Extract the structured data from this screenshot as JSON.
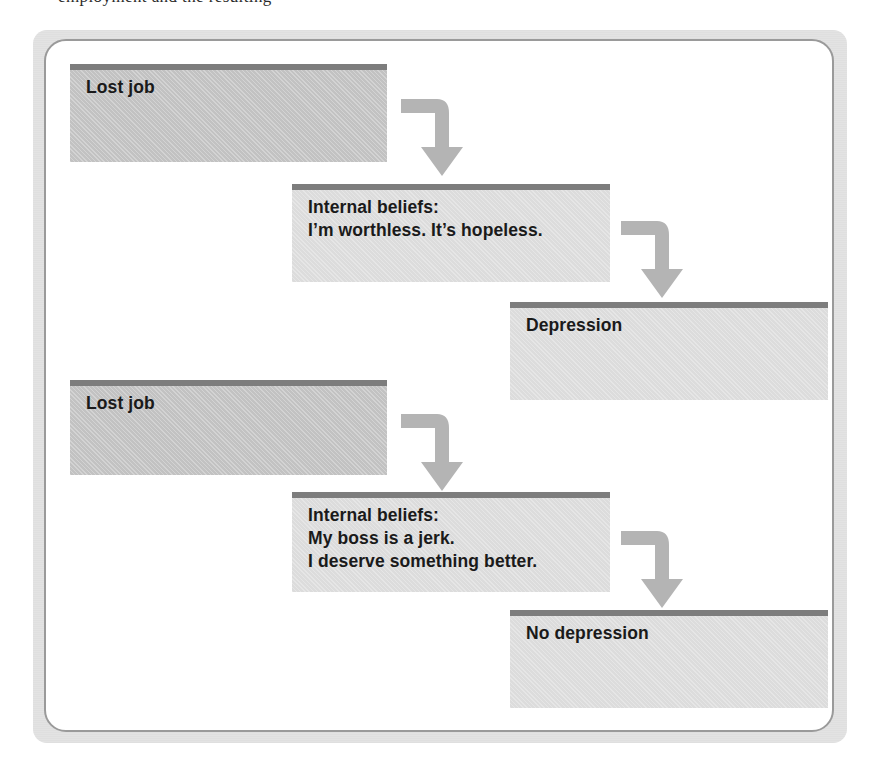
{
  "figure": {
    "type": "flowchart",
    "top_clipped_text": "employment and the resulting",
    "colors": {
      "box_top_bar": "#7d7d7d",
      "box_fill_dark": "#c2c2c2",
      "box_fill_light": "#dcdcdc",
      "arrow": "#b4b4b4",
      "panel_background": "#ffffff",
      "panel_border": "#9a9a9a",
      "scan_band": "#e3e3e3",
      "text": "#1a1a1a"
    },
    "chains": [
      {
        "name": "depression-chain",
        "nodes": [
          {
            "id": "lost-job-1",
            "label": "Lost job",
            "tone": "dark"
          },
          {
            "id": "internal-beliefs-1",
            "label": "Internal beliefs:\nI’m worthless. It’s hopeless.",
            "tone": "light"
          },
          {
            "id": "depression",
            "label": "Depression",
            "tone": "light"
          }
        ]
      },
      {
        "name": "no-depression-chain",
        "nodes": [
          {
            "id": "lost-job-2",
            "label": "Lost job",
            "tone": "dark"
          },
          {
            "id": "internal-beliefs-2",
            "label": "Internal beliefs:\nMy boss is a jerk.\nI deserve something better.",
            "tone": "light"
          },
          {
            "id": "no-depression",
            "label": "No depression",
            "tone": "light"
          }
        ]
      }
    ],
    "connectors": [
      {
        "id": "arrow-1",
        "from": "lost-job-1",
        "to": "internal-beliefs-1",
        "shape": "elbow-right-down"
      },
      {
        "id": "arrow-2",
        "from": "internal-beliefs-1",
        "to": "depression",
        "shape": "elbow-right-down"
      },
      {
        "id": "arrow-3",
        "from": "lost-job-2",
        "to": "internal-beliefs-2",
        "shape": "elbow-right-down"
      },
      {
        "id": "arrow-4",
        "from": "internal-beliefs-2",
        "to": "no-depression",
        "shape": "elbow-right-down"
      }
    ]
  }
}
